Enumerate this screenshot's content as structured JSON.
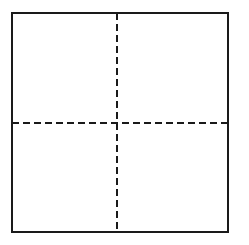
{
  "diagram": {
    "shape": "square-divided-into-quadrants",
    "stroke_color": "#1a1a1a",
    "background_color": "#ffffff",
    "outer_square": {
      "x": 12,
      "y": 13,
      "width": 216,
      "height": 219,
      "stroke_width": 2
    },
    "vertical_divider": {
      "x": 117,
      "y1": 13,
      "y2": 232,
      "style": "dashed",
      "dash": "7 4",
      "stroke_width": 2
    },
    "horizontal_divider": {
      "y": 123,
      "x1": 12,
      "x2": 230,
      "style": "dashed",
      "dash": "7 4",
      "stroke_width": 2
    },
    "quadrants": [
      "top-left",
      "top-right",
      "bottom-left",
      "bottom-right"
    ]
  }
}
